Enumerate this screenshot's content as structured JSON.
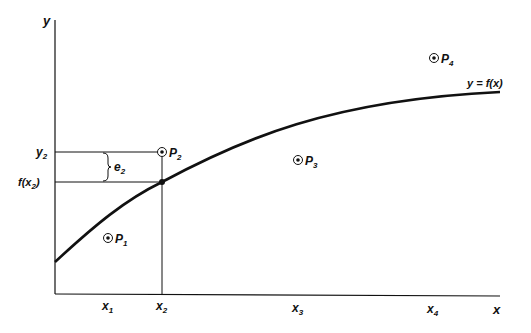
{
  "diagram": {
    "colors": {
      "ink": "#111111",
      "background": "#ffffff"
    },
    "axes": {
      "x_label": "x",
      "y_label": "y"
    },
    "curve_label": "y = f(x)",
    "x_ticks": [
      {
        "base": "x",
        "sub": "1"
      },
      {
        "base": "x",
        "sub": "2"
      },
      {
        "base": "x",
        "sub": "3"
      },
      {
        "base": "x",
        "sub": "4"
      }
    ],
    "y_labels": {
      "y2": {
        "base": "y",
        "sub": "2"
      },
      "fx2": {
        "pre": "f(x",
        "sub": "2",
        "post": ")"
      }
    },
    "error_label": {
      "base": "e",
      "sub": "2"
    },
    "points": [
      {
        "base": "P",
        "sub": "1"
      },
      {
        "base": "P",
        "sub": "2"
      },
      {
        "base": "P",
        "sub": "3"
      },
      {
        "base": "P",
        "sub": "4"
      }
    ]
  }
}
